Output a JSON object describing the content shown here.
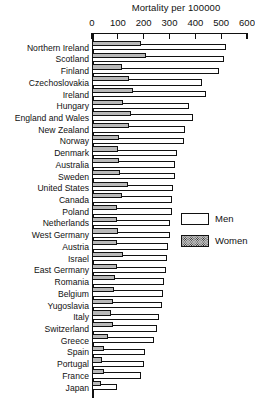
{
  "chart_data": {
    "type": "bar",
    "title": "Mortality per 100000",
    "xlabel": "",
    "ylabel": "",
    "orientation": "horizontal",
    "grid": false,
    "xlim": [
      0,
      600
    ],
    "xticks": [
      0,
      100,
      200,
      300,
      400,
      500,
      600
    ],
    "xticklabels": [
      "0",
      "100",
      "200",
      "300",
      "400",
      "500",
      "600"
    ],
    "legend_position": "right-middle",
    "legend": [
      {
        "name": "Men",
        "swatch": "white"
      },
      {
        "name": "Women",
        "swatch": "stippled"
      }
    ],
    "categories": [
      "Northern Ireland",
      "Scotland",
      "Finland",
      "Czechoslovakia",
      "Ireland",
      "Hungary",
      "England and Wales",
      "New Zealand",
      "Norway",
      "Denmark",
      "Australia",
      "Sweden",
      "United States",
      "Canada",
      "Poland",
      "Netherlands",
      "West Germany",
      "Austria",
      "Israel",
      "East Germany",
      "Romania",
      "Belgium",
      "Yugoslavia",
      "Italy",
      "Switzerland",
      "Greece",
      "Spain",
      "Portugal",
      "France",
      "Japan"
    ],
    "series": [
      {
        "name": "Men",
        "values": [
          520,
          510,
          490,
          425,
          440,
          375,
          390,
          360,
          355,
          330,
          320,
          320,
          315,
          310,
          310,
          300,
          300,
          295,
          290,
          285,
          280,
          275,
          270,
          260,
          250,
          240,
          205,
          200,
          190,
          95
        ]
      },
      {
        "name": "Women",
        "values": [
          190,
          210,
          115,
          145,
          160,
          120,
          150,
          145,
          105,
          100,
          105,
          110,
          140,
          115,
          95,
          95,
          100,
          95,
          120,
          95,
          90,
          85,
          80,
          75,
          80,
          60,
          45,
          40,
          45,
          35
        ]
      }
    ]
  }
}
